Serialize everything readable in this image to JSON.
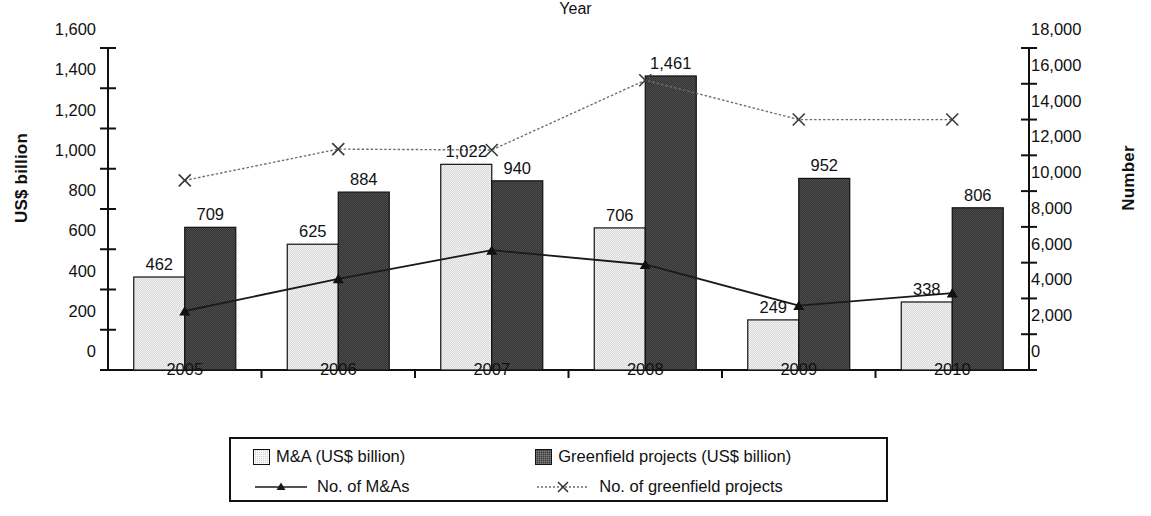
{
  "chart_data": {
    "type": "bar",
    "title": "",
    "xlabel": "Year",
    "ylabel": "US$ billion",
    "y2label": "Number",
    "categories": [
      "2005",
      "2006",
      "2007",
      "2008",
      "2009",
      "2010"
    ],
    "ylim": [
      0,
      1600
    ],
    "y2lim": [
      0,
      18000
    ],
    "grid": false,
    "legend_position": "bottom",
    "yticks": [
      "0",
      "200",
      "400",
      "600",
      "800",
      "1,000",
      "1,200",
      "1,400",
      "1,600"
    ],
    "ytick_values": [
      0,
      200,
      400,
      600,
      800,
      1000,
      1200,
      1400,
      1600
    ],
    "y2ticks": [
      "0",
      "2,000",
      "4,000",
      "6,000",
      "8,000",
      "10,000",
      "12,000",
      "14,000",
      "16,000",
      "18,000"
    ],
    "y2tick_values": [
      0,
      2000,
      4000,
      6000,
      8000,
      10000,
      12000,
      14000,
      16000,
      18000
    ],
    "series": [
      {
        "name": "M&A (US$ billion)",
        "kind": "bar",
        "axis": "left",
        "color": "#d2d2d2",
        "values": [
          462,
          625,
          1022,
          706,
          249,
          338
        ],
        "labels": [
          "462",
          "625",
          "1,022",
          "706",
          "249",
          "338"
        ]
      },
      {
        "name": "Greenfield projects (US$ billion)",
        "kind": "bar",
        "axis": "left",
        "color": "#3c3c3c",
        "values": [
          709,
          884,
          940,
          1461,
          952,
          806
        ],
        "labels": [
          "709",
          "884",
          "940",
          "1,461",
          "952",
          "806"
        ]
      },
      {
        "name": "No. of M&As",
        "kind": "line",
        "axis": "right",
        "marker": "triangle",
        "color": "#1a1a1a",
        "values": [
          3300,
          5100,
          6700,
          5900,
          3600,
          4300
        ]
      },
      {
        "name": "No. of greenfield projects",
        "kind": "line",
        "axis": "right",
        "marker": "x",
        "color": "#555555",
        "values": [
          10600,
          12350,
          12300,
          16200,
          14000,
          14000
        ]
      }
    ]
  },
  "legend": {
    "items": [
      {
        "label": "M&A (US$ billion)",
        "swatch": "light-square-swatch"
      },
      {
        "label": "Greenfield projects (US$ billion)",
        "swatch": "dark-square-swatch"
      },
      {
        "label": "No. of M&As",
        "swatch": "triangle-line-swatch"
      },
      {
        "label": "No. of greenfield projects",
        "swatch": "x-line-swatch"
      }
    ]
  }
}
